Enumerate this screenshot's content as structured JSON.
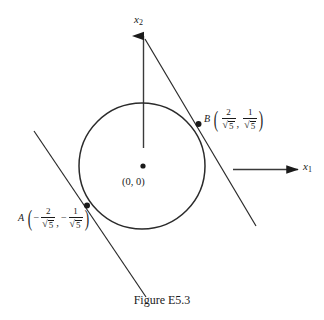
{
  "figure": {
    "caption": "Figure E5.3",
    "background_color": "#ffffff",
    "ink_color": "#1a1a1a"
  },
  "axes": {
    "vertical": {
      "name": "x",
      "subscript": "2",
      "arrow": "up-arrow-icon"
    },
    "horizontal": {
      "name": "x",
      "subscript": "1",
      "arrow": "right-arrow-icon"
    }
  },
  "origin": {
    "label": "(0, 0)",
    "marker": "origin-dot"
  },
  "points": [
    {
      "id": "B",
      "name": "B",
      "x_num": "2",
      "x_den_radicand": "5",
      "x_sign": "",
      "y_num": "1",
      "y_den_radicand": "5",
      "y_sign": "",
      "separator": ","
    },
    {
      "id": "A",
      "name": "A",
      "x_num": "2",
      "x_den_radicand": "5",
      "x_sign": "−",
      "y_num": "1",
      "y_den_radicand": "5",
      "y_sign": "−",
      "separator": ","
    }
  ],
  "shapes": {
    "circle": {
      "name": "unit-circle",
      "cx": 142,
      "cy": 166,
      "r": 63
    },
    "tangent_line_B": {
      "name": "tangent-line-at-B",
      "x1": 145,
      "y1": 39,
      "x2": 256,
      "y2": 226
    },
    "tangent_line_A": {
      "name": "tangent-line-at-A",
      "x1": 34,
      "y1": 131,
      "x2": 146,
      "y2": 297
    }
  },
  "radical_glyph": "√"
}
